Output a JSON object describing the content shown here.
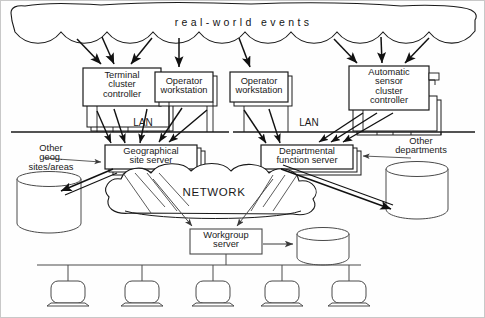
{
  "diagram": {
    "title": "real-world events",
    "cloud_label": "real-world events",
    "network_label": "NETWORK",
    "lan_label_left": "LAN",
    "lan_label_right": "LAN",
    "nodes": {
      "terminal_cluster_controller": "Terminal\ncluster\ncontroller",
      "operator_workstation_1": "Operator\nworkstation",
      "operator_workstation_2": "Operator\nworkstation",
      "automatic_sensor_cluster_controller": "Automatic\nsensor\ncluster\ncontroller",
      "geographical_site_server": "Geographical\nsite server",
      "departmental_function_server": "Departmental\nfunction server",
      "workgroup_server": "Workgroup\nserver"
    },
    "annotations": {
      "other_geog_sites": "Other\ngeog.\nsites/areas",
      "other_departments": "Other\ndepartments"
    },
    "databases": [
      {
        "name": "geog-sites-database"
      },
      {
        "name": "other-departments-database"
      },
      {
        "name": "workgroup-database"
      }
    ],
    "workstations_count": 5,
    "colors": {
      "stroke": "#1a1a1a",
      "thin_stroke": "#4a4a4a",
      "fill": "#ffffff",
      "arrow": "#111111",
      "background": "#fefefe",
      "border": "#c8c8c8"
    }
  }
}
